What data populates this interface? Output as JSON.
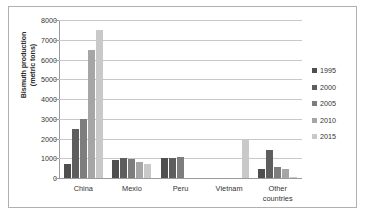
{
  "chart_data": {
    "type": "bar",
    "title": "",
    "xlabel": "",
    "ylabel": "Bismuth production (metric tons)",
    "ylabel_line1": "Bismuth production",
    "ylabel_line2": "(metric tons)",
    "categories": [
      "China",
      "Mexio",
      "Peru",
      "Vietnam",
      "Other countries"
    ],
    "category_labels": [
      {
        "line1": "China",
        "line2": ""
      },
      {
        "line1": "Mexio",
        "line2": ""
      },
      {
        "line1": "Peru",
        "line2": ""
      },
      {
        "line1": "Vietnam",
        "line2": ""
      },
      {
        "line1": "Other",
        "line2": "countries"
      }
    ],
    "series": [
      {
        "name": "1995",
        "color": "#4f4f4f",
        "values": [
          700,
          900,
          1000,
          0,
          450
        ]
      },
      {
        "name": "2000",
        "color": "#5e5e5e",
        "values": [
          2500,
          1000,
          1000,
          0,
          1400
        ]
      },
      {
        "name": "2005",
        "color": "#7d7d7d",
        "values": [
          3000,
          950,
          1080,
          0,
          550
        ]
      },
      {
        "name": "2010",
        "color": "#a6a6a6",
        "values": [
          6500,
          820,
          0,
          0,
          450
        ]
      },
      {
        "name": "2015",
        "color": "#c9c9c9",
        "values": [
          7500,
          700,
          0,
          2000,
          50
        ]
      }
    ],
    "ylim": [
      0,
      8000
    ],
    "ytick_values": [
      0,
      1000,
      2000,
      3000,
      4000,
      5000,
      6000,
      7000,
      8000
    ],
    "ytick_labels": [
      "0",
      "1000",
      "2000",
      "3000",
      "4000",
      "5000",
      "6000",
      "7000",
      "8000"
    ],
    "grid": true,
    "legend_position": "right",
    "legend_entries": [
      "1995",
      "2000",
      "2005",
      "2010",
      "2015"
    ]
  }
}
